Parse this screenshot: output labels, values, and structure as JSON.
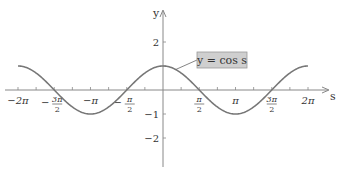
{
  "chart_data": {
    "type": "line",
    "title": "",
    "xlabel": "s",
    "ylabel": "y",
    "series": [
      {
        "name": "y = cos s",
        "function": "cos",
        "domain": [
          -6.2832,
          6.2832
        ],
        "color": "#777777"
      }
    ],
    "annotation": {
      "text": "y = cos s",
      "box_fill": "#cfcfcf",
      "box_stroke": "#999999"
    },
    "x_ticks": [
      {
        "value": -6.2832,
        "label": "−2π",
        "kind": "simple"
      },
      {
        "value": -4.7124,
        "label_num": "3π",
        "label_den": "2",
        "sign": "−",
        "kind": "frac"
      },
      {
        "value": -3.1416,
        "label": "−π",
        "kind": "simple"
      },
      {
        "value": -1.5708,
        "label_num": "π",
        "label_den": "2",
        "sign": "−",
        "kind": "frac"
      },
      {
        "value": 1.5708,
        "label_num": "π",
        "label_den": "2",
        "sign": "",
        "kind": "frac"
      },
      {
        "value": 3.1416,
        "label": "π",
        "kind": "simple"
      },
      {
        "value": 4.7124,
        "label_num": "3π",
        "label_den": "2",
        "sign": "",
        "kind": "frac"
      },
      {
        "value": 6.2832,
        "label": "2π",
        "kind": "simple"
      }
    ],
    "x_minor_tick_step": 0.7854,
    "y_ticks": [
      {
        "value": 2,
        "label": "2"
      },
      {
        "value": 1,
        "label": ""
      },
      {
        "value": -1,
        "label": "−1"
      },
      {
        "value": -2,
        "label": "−2"
      }
    ],
    "xlim": [
      -7.2,
      7.2
    ],
    "ylim": [
      -3.2,
      3.3
    ],
    "grid": false,
    "legend": "none",
    "axis_color": "#888888"
  }
}
